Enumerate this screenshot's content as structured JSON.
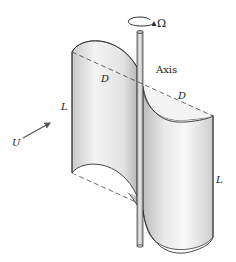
{
  "diagram": {
    "labels": {
      "rotation": "Ω",
      "axis": "Axis",
      "diameter_left": "D",
      "diameter_right": "D",
      "length_left": "L",
      "length_right": "L",
      "wind_velocity": "U"
    },
    "colors": {
      "stroke": "#333333",
      "blade_light": "#f7f7f7",
      "blade_mid": "#dcdcdc",
      "blade_dark": "#b8b8b8",
      "dash": "#444444"
    }
  }
}
